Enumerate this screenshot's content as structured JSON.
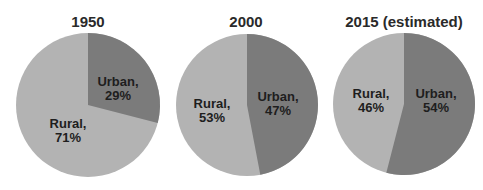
{
  "chart_data": [
    {
      "type": "pie",
      "title": "1950",
      "categories": [
        "Urban",
        "Rural"
      ],
      "values": [
        29,
        71
      ],
      "labels": [
        [
          "Urban,",
          "29%"
        ],
        [
          "Rural,",
          "71%"
        ]
      ],
      "colors": [
        "#7b7b7b",
        "#b3b3b3"
      ]
    },
    {
      "type": "pie",
      "title": "2000",
      "categories": [
        "Urban",
        "Rural"
      ],
      "values": [
        47,
        53
      ],
      "labels": [
        [
          "Urban,",
          "47%"
        ],
        [
          "Rural,",
          "53%"
        ]
      ],
      "colors": [
        "#7b7b7b",
        "#b3b3b3"
      ]
    },
    {
      "type": "pie",
      "title": "2015 (estimated)",
      "categories": [
        "Urban",
        "Rural"
      ],
      "values": [
        54,
        46
      ],
      "labels": [
        [
          "Urban,",
          "54%"
        ],
        [
          "Rural,",
          "46%"
        ]
      ],
      "colors": [
        "#7b7b7b",
        "#b3b3b3"
      ]
    }
  ],
  "charts": [
    {
      "title": "1950",
      "urban_l1": "Urban,",
      "urban_l2": "29%",
      "rural_l1": "Rural,",
      "rural_l2": "71%"
    },
    {
      "title": "2000",
      "urban_l1": "Urban,",
      "urban_l2": "47%",
      "rural_l1": "Rural,",
      "rural_l2": "53%"
    },
    {
      "title": "2015 (estimated)",
      "urban_l1": "Urban,",
      "urban_l2": "54%",
      "rural_l1": "Rural,",
      "rural_l2": "46%"
    }
  ]
}
